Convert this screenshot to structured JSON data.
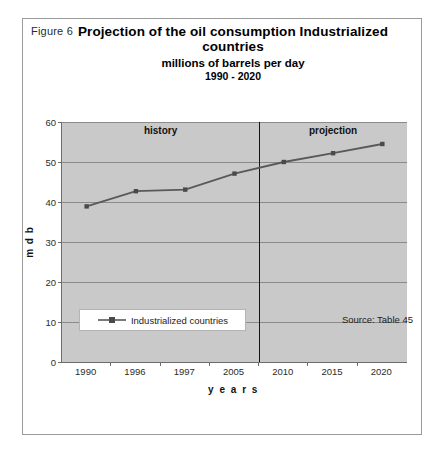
{
  "figure": {
    "label": "Figure 6",
    "title_line1": "Projection of the oil consumption Industrialized",
    "title_line2": "countries",
    "subtitle": "millions of barrels per day",
    "range": "1990 - 2020",
    "source": "Source: Table 45"
  },
  "legend": {
    "items": [
      {
        "label": "Industrialized countries",
        "color": "#595959"
      }
    ]
  },
  "chart_data": {
    "type": "line",
    "title": "Projection of the oil consumption Industrialized countries",
    "subtitle": "millions of barrels per day",
    "range": "1990 - 2020",
    "xlabel": "y e a r s",
    "ylabel": "m d b",
    "categories": [
      "1990",
      "1996",
      "1997",
      "2005",
      "2010",
      "2015",
      "2020"
    ],
    "series": [
      {
        "name": "Industrialized countries",
        "color": "#595959",
        "values": [
          38.9,
          42.7,
          43.1,
          47.1,
          50.0,
          52.2,
          54.5
        ]
      }
    ],
    "ylim": [
      0,
      60
    ],
    "yticks": [
      "0",
      "10",
      "20",
      "30",
      "40",
      "50",
      "60"
    ],
    "ytick_values": [
      0,
      10,
      20,
      30,
      40,
      50,
      60
    ],
    "grid": true,
    "legend_position": "bottom",
    "plot_background": "#c9c9c9",
    "annotations": [
      {
        "text": "history",
        "position": "left-of-divider"
      },
      {
        "text": "projection",
        "position": "right-of-divider"
      }
    ],
    "divider": {
      "between": [
        "2005",
        "2010"
      ],
      "label": "history / projection boundary"
    }
  }
}
